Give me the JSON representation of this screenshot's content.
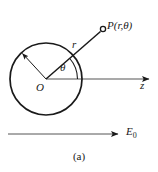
{
  "figure": {
    "caption": "(a)",
    "labels": {
      "point_P": "P(r,θ)",
      "radius_vector": "r",
      "angle": "θ",
      "origin": "O",
      "axis_z": "z",
      "field": "E",
      "field_subscript": "0"
    },
    "colors": {
      "stroke": "#1a1a1a",
      "background": "#ffffff",
      "axis": "#555555"
    },
    "geometry": {
      "circle_center_x": 46,
      "circle_center_y": 79,
      "circle_radius": 36,
      "point_P_x": 103,
      "point_P_y": 29,
      "z_axis_end_x": 150,
      "z_axis_y": 79,
      "field_arrow_y": 134,
      "field_arrow_start_x": 8,
      "field_arrow_end_x": 119,
      "radius_arrow_angle_deg": 135,
      "theta_angle_deg": 41
    }
  }
}
